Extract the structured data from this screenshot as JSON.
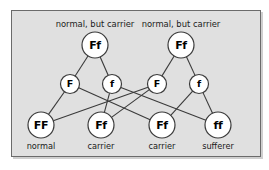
{
  "figure": {
    "panel_bg": "#e0e0e0",
    "panel_border": "#6b6b6b",
    "circle_fill": "#ffffff",
    "circle_stroke": "#3a3a3a",
    "line_color": "#3a3a3a"
  },
  "parents": [
    {
      "id": "parent-left",
      "genotype": "Ff",
      "caption": "normal, but carrier",
      "cx": 95,
      "cy": 45,
      "r": 13,
      "caption_x": 95,
      "caption_y": 20
    },
    {
      "id": "parent-right",
      "genotype": "Ff",
      "caption": "normal, but carrier",
      "cx": 181,
      "cy": 45,
      "r": 13,
      "caption_x": 181,
      "caption_y": 20
    }
  ],
  "gametes": [
    {
      "id": "gamete-f-upper-left",
      "allele": "F",
      "cx": 70,
      "cy": 84,
      "r": 9.5
    },
    {
      "id": "gamete-f-lower-left",
      "allele": "f",
      "cx": 112,
      "cy": 84,
      "r": 9.5
    },
    {
      "id": "gamete-f-upper-right",
      "allele": "F",
      "cx": 157,
      "cy": 84,
      "r": 9.5
    },
    {
      "id": "gamete-f-lower-right",
      "allele": "f",
      "cx": 199,
      "cy": 84,
      "r": 9.5
    }
  ],
  "offspring": [
    {
      "id": "offspring-ff-normal",
      "genotype": "FF",
      "caption": "normal",
      "cx": 41,
      "cy": 125,
      "r": 13,
      "caption_x": 41,
      "caption_y": 142
    },
    {
      "id": "offspring-fF-carrier1",
      "genotype": "Ff",
      "caption": "carrier",
      "cx": 101,
      "cy": 125,
      "r": 13,
      "caption_x": 101,
      "caption_y": 142
    },
    {
      "id": "offspring-fF-carrier2",
      "genotype": "Ff",
      "caption": "carrier",
      "cx": 162,
      "cy": 125,
      "r": 13,
      "caption_x": 162,
      "caption_y": 142
    },
    {
      "id": "offspring-ff-sufferer",
      "genotype": "ff",
      "caption": "sufferer",
      "cx": 218,
      "cy": 125,
      "r": 13,
      "caption_x": 218,
      "caption_y": 142
    }
  ],
  "edges": [
    {
      "from": "parent-left",
      "to": "gamete-f-upper-left"
    },
    {
      "from": "parent-left",
      "to": "gamete-f-lower-left"
    },
    {
      "from": "parent-right",
      "to": "gamete-f-upper-right"
    },
    {
      "from": "parent-right",
      "to": "gamete-f-lower-right"
    },
    {
      "from": "gamete-f-upper-left",
      "to": "offspring-ff-normal"
    },
    {
      "from": "gamete-f-upper-left",
      "to": "offspring-fF-carrier2"
    },
    {
      "from": "gamete-f-lower-left",
      "to": "offspring-fF-carrier1"
    },
    {
      "from": "gamete-f-lower-left",
      "to": "offspring-ff-sufferer"
    },
    {
      "from": "gamete-f-upper-right",
      "to": "offspring-ff-normal"
    },
    {
      "from": "gamete-f-upper-right",
      "to": "offspring-fF-carrier1"
    },
    {
      "from": "gamete-f-lower-right",
      "to": "offspring-fF-carrier2"
    },
    {
      "from": "gamete-f-lower-right",
      "to": "offspring-ff-sufferer"
    }
  ]
}
